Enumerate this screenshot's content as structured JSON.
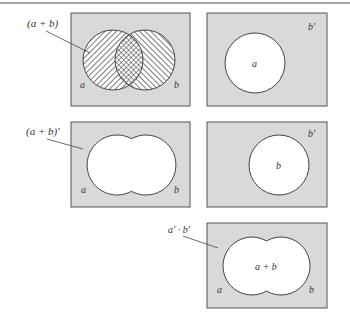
{
  "figure": {
    "top_rule_color": "#888888",
    "panel_fill": "#d9d9d9",
    "region_fill": "#ffffff",
    "panels": [
      {
        "id": "panel-1",
        "callout": "(a + b)",
        "left_label": "a",
        "right_label": "b",
        "description": "Venn diagram: a hatched one direction, b hatched other direction, overlap cross-hatched"
      },
      {
        "id": "panel-2",
        "corner_label": "b'",
        "circle_label": "a"
      },
      {
        "id": "panel-3",
        "callout": "(a + b)'",
        "left_label": "a",
        "right_label": "b"
      },
      {
        "id": "panel-4",
        "corner_label": "b'",
        "circle_label": "b"
      },
      {
        "id": "panel-5",
        "callout": "a' · b'",
        "center_label": "a + b",
        "left_label": "a",
        "right_label": "b"
      }
    ]
  }
}
